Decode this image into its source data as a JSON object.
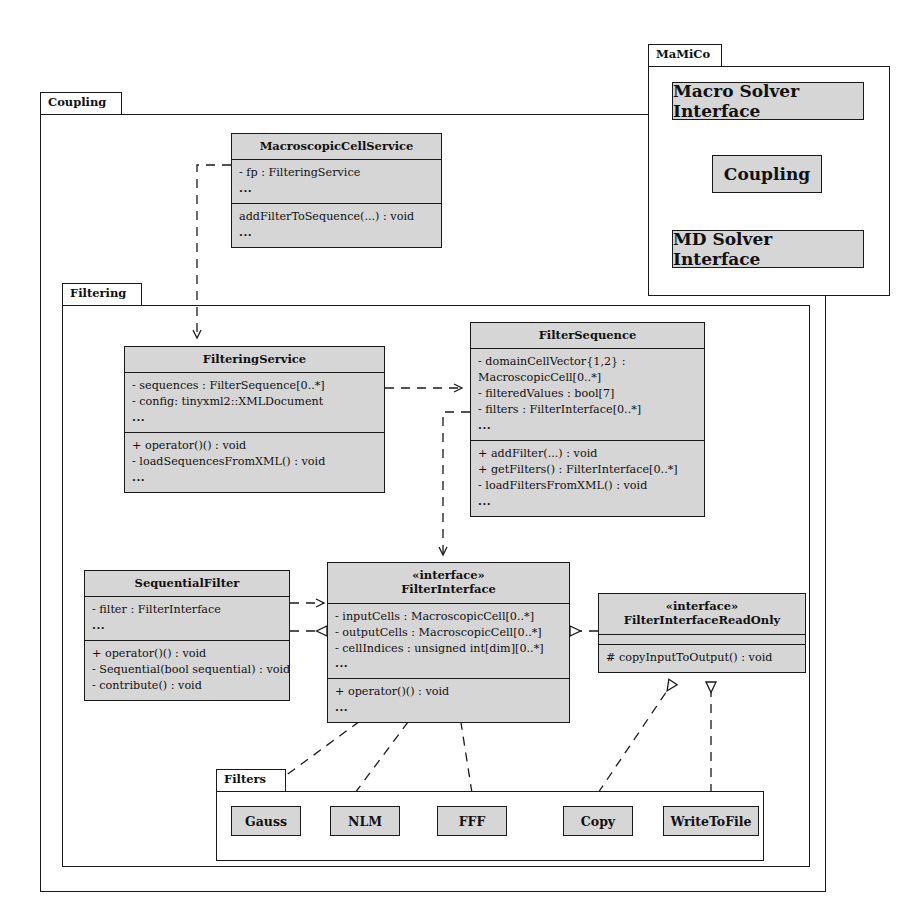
{
  "diagram": {
    "packages": [
      {
        "id": "coupling",
        "label": "Coupling"
      },
      {
        "id": "filtering",
        "label": "Filtering"
      },
      {
        "id": "mamico",
        "label": "MaMiCo"
      },
      {
        "id": "filters",
        "label": "Filters"
      }
    ]
  },
  "mamico": {
    "label": "MaMiCo",
    "items": [
      {
        "label": "Macro Solver Interface"
      },
      {
        "label": "Coupling"
      },
      {
        "label": "MD Solver Interface"
      }
    ]
  },
  "coupling": {
    "label": "Coupling"
  },
  "filtering": {
    "label": "Filtering"
  },
  "filters": {
    "label": "Filters",
    "items": [
      {
        "label": "Gauss"
      },
      {
        "label": "NLM"
      },
      {
        "label": "FFF"
      },
      {
        "label": "Copy"
      },
      {
        "label": "WriteToFile"
      }
    ]
  },
  "classes": {
    "macroscopic_cell_service": {
      "name": "MacroscopicCellService",
      "attributes": [
        "- fp : FilteringService",
        "..."
      ],
      "operations": [
        "addFilterToSequence(...) : void",
        "..."
      ]
    },
    "filtering_service": {
      "name": "FilteringService",
      "attributes": [
        "- sequences : FilterSequence[0..*]",
        "- config: tinyxml2::XMLDocument",
        "..."
      ],
      "operations": [
        "+ operator()() : void",
        "- loadSequencesFromXML() : void",
        "..."
      ]
    },
    "filter_sequence": {
      "name": "FilterSequence",
      "attributes": [
        "- domainCellVector{1,2} : MacroscopicCell[0..*]",
        "- filteredValues : bool[7]",
        "- filters : FilterInterface[0..*]",
        "..."
      ],
      "operations": [
        "+ addFilter(...) : void",
        "+ getFilters() : FilterInterface[0..*]",
        "- loadFiltersFromXML() : void",
        "..."
      ]
    },
    "sequential_filter": {
      "name": "SequentialFilter",
      "attributes": [
        "- filter : FilterInterface",
        "..."
      ],
      "operations": [
        "+ operator()() : void",
        "- Sequential(bool sequential) : void",
        "- contribute() : void"
      ]
    },
    "filter_interface": {
      "stereotype": "«interface»",
      "name": "FilterInterface",
      "attributes": [
        "- inputCells : MacroscopicCell[0..*]",
        "- outputCells : MacroscopicCell[0..*]",
        "- cellIndices : unsigned int[dim][0..*]",
        "..."
      ],
      "operations": [
        "+ operator()() : void",
        "..."
      ]
    },
    "filter_interface_read_only": {
      "stereotype": "«interface»",
      "name": "FilterInterfaceReadOnly",
      "attributes": [],
      "operations": [
        "# copyInputToOutput() : void"
      ]
    }
  },
  "colors": {
    "box_fill": "#d6d6d6",
    "line": "#1a1a1a",
    "background": "#ffffff"
  }
}
